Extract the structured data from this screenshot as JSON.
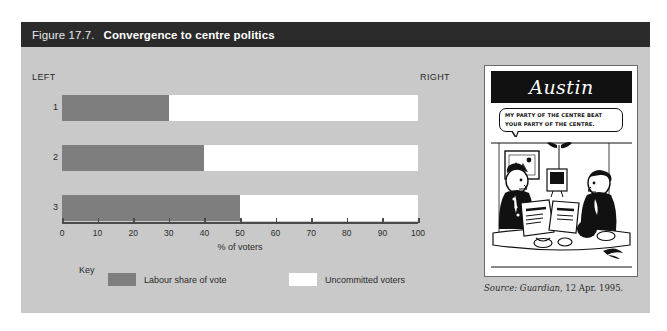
{
  "figure": {
    "number": "Figure 17.7.",
    "title": "Convergence to centre politics"
  },
  "chart_data": {
    "type": "bar",
    "orientation": "horizontal",
    "stacked": true,
    "title": "Convergence to centre politics",
    "categories": [
      "1",
      "2",
      "3"
    ],
    "series": [
      {
        "name": "Labour share of vote",
        "values": [
          30,
          40,
          50
        ],
        "color": "#7e7e7e"
      },
      {
        "name": "Uncommitted voters",
        "values": [
          70,
          60,
          50
        ],
        "color": "#ffffff"
      }
    ],
    "xlabel": "% of voters",
    "ylabel": "",
    "xlim": [
      0,
      100
    ],
    "xticks": [
      0,
      10,
      20,
      30,
      40,
      50,
      60,
      70,
      80,
      90,
      100
    ],
    "xtick_labels": [
      "0",
      "10",
      "20",
      "30",
      "40",
      "50",
      "60",
      "70",
      "80",
      "90",
      "100"
    ],
    "grid": false,
    "legend_position": "bottom",
    "annotations": [
      "LEFT",
      "RIGHT"
    ]
  },
  "axis": {
    "left_label": "LEFT",
    "right_label": "RIGHT",
    "x_title": "% of voters",
    "tick_labels": [
      "0",
      "10",
      "20",
      "30",
      "40",
      "50",
      "60",
      "70",
      "80",
      "90",
      "100"
    ]
  },
  "rows": [
    {
      "label": "1",
      "labour": 30,
      "uncommitted": 70
    },
    {
      "label": "2",
      "labour": 40,
      "uncommitted": 60
    },
    {
      "label": "3",
      "labour": 50,
      "uncommitted": 50
    }
  ],
  "legend": {
    "key_label": "Key",
    "items": [
      {
        "label": "Labour share of vote",
        "color": "#7e7e7e"
      },
      {
        "label": "Uncommitted voters",
        "color": "#ffffff"
      }
    ]
  },
  "cartoon": {
    "signature": "Austin",
    "speech_line_1": "MY PARTY OF THE CENTRE BEAT",
    "speech_line_2": "YOUR PARTY OF THE CENTRE."
  },
  "source": {
    "label": "Source:",
    "publication": "Guardian",
    "date": ", 12 Apr. 1995."
  },
  "colors": {
    "header_bg": "#2b2b2b",
    "panel_bg": "#c9c9c9",
    "bar_fill": "#7e7e7e",
    "bar_empty": "#ffffff",
    "axis": "#4a4a4a"
  }
}
